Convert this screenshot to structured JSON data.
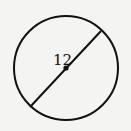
{
  "diagram": {
    "type": "circle-with-diameter",
    "circle": {
      "cx": 66,
      "cy": 68,
      "r": 52,
      "stroke": "#111111",
      "fill": "none"
    },
    "diameter": {
      "x1": 30,
      "y1": 107,
      "x2": 101,
      "y2": 31
    },
    "center_point": {
      "x": 66,
      "y": 68
    },
    "label": {
      "text": "12",
      "x": 53,
      "y": 65
    }
  }
}
